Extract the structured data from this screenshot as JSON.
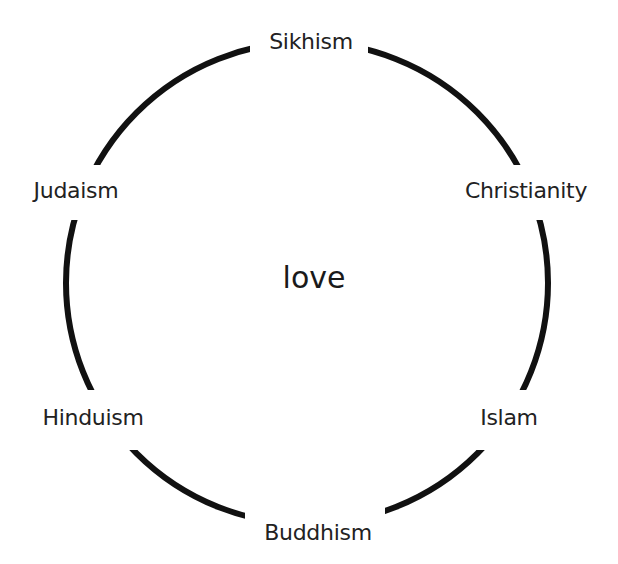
{
  "diagram": {
    "type": "circular-cycle",
    "center": {
      "label": "love"
    },
    "nodes": [
      {
        "label": "Sikhism",
        "position": "top"
      },
      {
        "label": "Christianity",
        "position": "upper-right"
      },
      {
        "label": "Islam",
        "position": "lower-right"
      },
      {
        "label": "Buddhism",
        "position": "bottom"
      },
      {
        "label": "Hinduism",
        "position": "lower-left"
      },
      {
        "label": "Judaism",
        "position": "upper-left"
      }
    ],
    "colors": {
      "ring": "#111111",
      "text": "#222222",
      "background": "#ffffff"
    }
  }
}
